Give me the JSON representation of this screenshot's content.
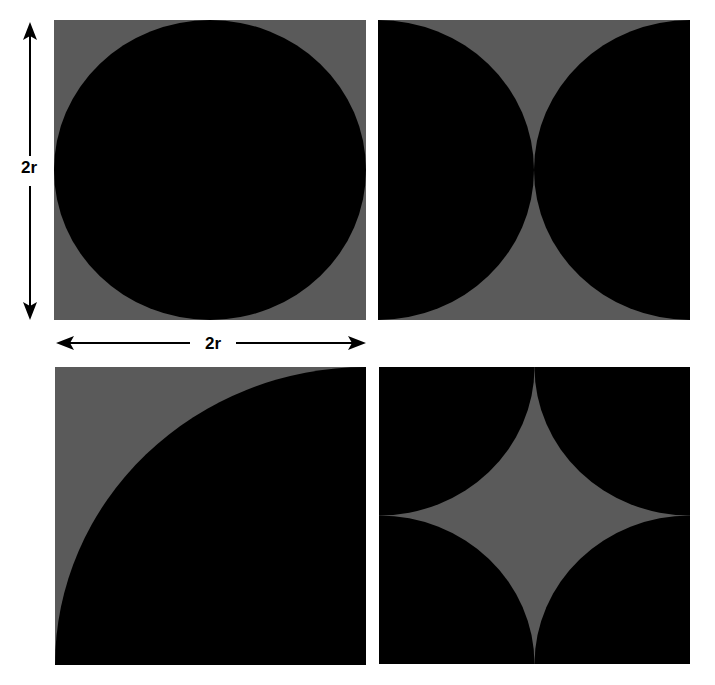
{
  "colors": {
    "background": "#ffffff",
    "square_fill": "#5a5a5a",
    "circle_fill": "#000000",
    "arrow": "#000000"
  },
  "dimensions": {
    "vertical_label": "2r",
    "horizontal_label": "2r"
  },
  "panels": [
    {
      "id": "top-left",
      "description": "square with inscribed full circle of radius r"
    },
    {
      "id": "top-right",
      "description": "square with two half circles on left and right sides meeting at center"
    },
    {
      "id": "bottom-left",
      "description": "square with quarter circle of radius 2r centered at bottom-right corner"
    },
    {
      "id": "bottom-right",
      "description": "square with four quarter circles at corners leaving a central astroid-like gray star"
    }
  ]
}
